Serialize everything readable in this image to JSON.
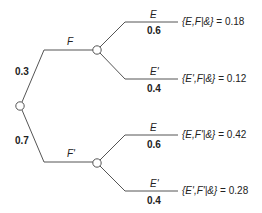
{
  "diagram": {
    "type": "probability-tree",
    "colors": {
      "line": "#555555",
      "node_fill": "#ffffff",
      "text": "#222222"
    },
    "root": {
      "name": "root-node"
    },
    "first_level": [
      {
        "event": "F",
        "probability": "0.3"
      },
      {
        "event": "F'",
        "probability": "0.7"
      }
    ],
    "leaves": [
      {
        "parent": "F",
        "event": "E",
        "probability": "0.6",
        "joint_label": "{E,F|&}",
        "joint_eq": "= 0.18"
      },
      {
        "parent": "F",
        "event": "E'",
        "probability": "0.4",
        "joint_label": "{E',F|&}",
        "joint_eq": "= 0.12"
      },
      {
        "parent": "F'",
        "event": "E",
        "probability": "0.6",
        "joint_label": "{E,F'|&}",
        "joint_eq": "= 0.42"
      },
      {
        "parent": "F'",
        "event": "E'",
        "probability": "0.4",
        "joint_label": "{E',F'|&}",
        "joint_eq": "= 0.28"
      }
    ]
  }
}
